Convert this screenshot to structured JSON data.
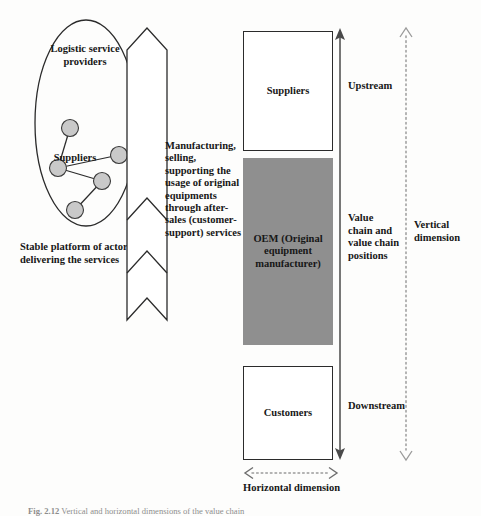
{
  "figure": {
    "caption_number": "Fig. 2.12",
    "caption_text": "Vertical and horizontal dimensions of the value chain"
  },
  "platform": {
    "top_label": "Logistic service providers",
    "node_label": "Suppliers",
    "description": "Stable platform of actors delivering the services",
    "node_fill": "#c9c9c9",
    "nodes": [
      {
        "id": "n1",
        "cx": 52,
        "cy": 110
      },
      {
        "id": "n2",
        "cx": 40,
        "cy": 150
      },
      {
        "id": "n3",
        "cx": 101,
        "cy": 137
      },
      {
        "id": "n4",
        "cx": 84,
        "cy": 163
      },
      {
        "id": "n5",
        "cx": 57,
        "cy": 192
      }
    ],
    "edges": [
      {
        "from": "n1",
        "to": "n2"
      },
      {
        "from": "n2",
        "to": "n3"
      },
      {
        "from": "n2",
        "to": "n4"
      },
      {
        "from": "n4",
        "to": "n5"
      }
    ]
  },
  "ribbon": {
    "text": "Manufacturing, selling, supporting the usage of original equipments through after-sales (customer-support) services"
  },
  "value_chain": {
    "boxes": [
      {
        "key": "suppliers",
        "label": "Suppliers",
        "fill": "#ffffff"
      },
      {
        "key": "oem",
        "label": "OEM (Original equipment manufacturer)",
        "fill": "#8f8f8f"
      },
      {
        "key": "customers",
        "label": "Customers",
        "fill": "#ffffff"
      }
    ]
  },
  "annotations": {
    "upstream": "Upstream",
    "value_chain_positions": "Value chain and value chain positions",
    "downstream": "Downstream",
    "vertical_dimension": "Vertical dimension",
    "horizontal_dimension": "Horizontal dimension"
  }
}
